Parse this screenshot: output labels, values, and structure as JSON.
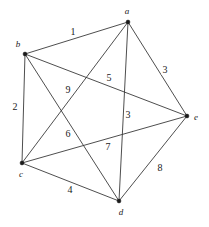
{
  "figure": {
    "width": 209,
    "height": 227,
    "background_color": "#ffffff",
    "edge_color": "#3a3a3a",
    "vertex_color": "#1a1a1a",
    "label_color": "#1a1a1a"
  },
  "chart_data": {
    "type": "diagram",
    "graph_type": "undirected weighted complete graph (K5)",
    "title": "",
    "vertex_count": 5,
    "edge_count": 10,
    "vertices": [
      {
        "id": "a",
        "label": "a",
        "x": 128,
        "y": 22,
        "label_x": 127,
        "label_y": 11
      },
      {
        "id": "b",
        "label": "b",
        "x": 25,
        "y": 54,
        "label_x": 18,
        "label_y": 44
      },
      {
        "id": "c",
        "label": "c",
        "x": 22,
        "y": 163,
        "label_x": 21,
        "label_y": 174
      },
      {
        "id": "d",
        "label": "d",
        "x": 119,
        "y": 201,
        "label_x": 121,
        "label_y": 212
      },
      {
        "id": "e",
        "label": "e",
        "x": 187,
        "y": 116,
        "label_x": 196,
        "label_y": 117
      }
    ],
    "edges": [
      {
        "from": "b",
        "to": "a",
        "weight": "1",
        "label_x": 73,
        "label_y": 32
      },
      {
        "from": "b",
        "to": "c",
        "weight": "2",
        "label_x": 15,
        "label_y": 107
      },
      {
        "from": "a",
        "to": "e",
        "weight": "3",
        "label_x": 165,
        "label_y": 70
      },
      {
        "from": "c",
        "to": "d",
        "weight": "4",
        "label_x": 70,
        "label_y": 190
      },
      {
        "from": "a",
        "to": "c",
        "weight": "5",
        "label_x": 109,
        "label_y": 78
      },
      {
        "from": "b",
        "to": "d",
        "weight": "6",
        "label_x": 68,
        "label_y": 134
      },
      {
        "from": "c",
        "to": "e",
        "weight": "7",
        "label_x": 108,
        "label_y": 147
      },
      {
        "from": "d",
        "to": "e",
        "weight": "8",
        "label_x": 160,
        "label_y": 168
      },
      {
        "from": "b",
        "to": "e",
        "weight": "9",
        "label_x": 68,
        "label_y": 90
      },
      {
        "from": "a",
        "to": "d",
        "weight": "3",
        "label_x": 128,
        "label_y": 115
      }
    ],
    "weights_listed": [
      "1",
      "2",
      "3",
      "4",
      "5",
      "6",
      "7",
      "8",
      "9",
      "3"
    ]
  }
}
